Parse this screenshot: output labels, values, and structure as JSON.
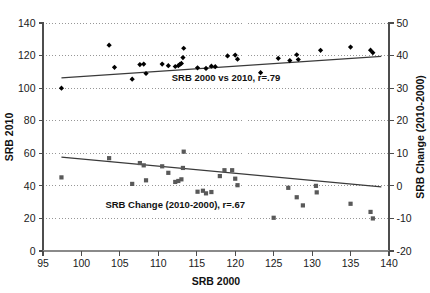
{
  "chart_data": {
    "type": "scatter",
    "title": "",
    "xlabel": "SRB 2000",
    "ylabel": "SRB 2010",
    "y2label": "SRB Change (2010-2000)",
    "xlim": [
      95,
      140
    ],
    "ylim": [
      0,
      140
    ],
    "y2lim": [
      -20,
      50
    ],
    "xticks": [
      95,
      100,
      105,
      110,
      115,
      120,
      125,
      130,
      135,
      140
    ],
    "yticks": [
      0,
      20,
      40,
      60,
      80,
      100,
      120,
      140
    ],
    "y2ticks": [
      -20,
      -10,
      0,
      10,
      20,
      30,
      40,
      50
    ],
    "grid": true,
    "grid_style": "dotted-horizontal",
    "legend_position": "none",
    "annotations": [
      {
        "name": "srb-2000-vs-2010-annotation",
        "text": "SRB 2000 vs 2010, r=.79",
        "x": 118.8,
        "y_left": 104.5
      },
      {
        "name": "srb-change-annotation",
        "text": "SRB Change (2010-2000), r=.67",
        "x": 112.2,
        "y_left": 26.5
      }
    ],
    "series": [
      {
        "name": "SRB 2000 vs 2010",
        "axis": "left",
        "marker": "diamond",
        "color": "#000000",
        "correlation": ".79",
        "points": [
          [
            97.4,
            100.0
          ],
          [
            103.6,
            126.4
          ],
          [
            104.3,
            112.8
          ],
          [
            106.6,
            105.5
          ],
          [
            107.6,
            114.5
          ],
          [
            108.1,
            114.8
          ],
          [
            108.4,
            109.0
          ],
          [
            110.5,
            114.8
          ],
          [
            111.3,
            113.8
          ],
          [
            112.2,
            113.3
          ],
          [
            112.6,
            113.8
          ],
          [
            112.8,
            114.6
          ],
          [
            113.0,
            115.2
          ],
          [
            113.2,
            118.8
          ],
          [
            113.3,
            124.5
          ],
          [
            115.1,
            112.5
          ],
          [
            116.2,
            112.1
          ],
          [
            116.9,
            113.5
          ],
          [
            117.4,
            113.2
          ],
          [
            119.0,
            119.8
          ],
          [
            120.0,
            120.3
          ],
          [
            120.3,
            117.8
          ],
          [
            123.3,
            109.5
          ],
          [
            125.6,
            118.3
          ],
          [
            127.1,
            116.9
          ],
          [
            128.0,
            120.5
          ],
          [
            128.2,
            117.6
          ],
          [
            131.1,
            123.2
          ],
          [
            135.0,
            125.2
          ],
          [
            137.6,
            123.3
          ],
          [
            137.9,
            121.8
          ]
        ],
        "trendline": {
          "x1": 97.4,
          "y1": 106.3,
          "x2": 139.0,
          "y2": 119.5
        }
      },
      {
        "name": "SRB Change (2010-2000)",
        "axis": "right",
        "marker": "square",
        "color": "#595959",
        "correlation": ".67",
        "points": [
          [
            97.4,
            2.6
          ],
          [
            103.6,
            8.5
          ],
          [
            106.6,
            0.6
          ],
          [
            107.6,
            7.0
          ],
          [
            108.1,
            6.3
          ],
          [
            108.4,
            1.7
          ],
          [
            110.5,
            6.0
          ],
          [
            111.3,
            4.0
          ],
          [
            112.2,
            1.2
          ],
          [
            112.6,
            1.5
          ],
          [
            113.0,
            2.0
          ],
          [
            113.2,
            5.5
          ],
          [
            113.3,
            10.5
          ],
          [
            115.1,
            -1.8
          ],
          [
            115.8,
            -1.5
          ],
          [
            116.2,
            -2.3
          ],
          [
            116.9,
            -1.9
          ],
          [
            118.0,
            3.0
          ],
          [
            118.6,
            4.8
          ],
          [
            119.6,
            4.8
          ],
          [
            120.0,
            2.2
          ],
          [
            120.3,
            0.2
          ],
          [
            125.0,
            -9.8
          ],
          [
            126.9,
            -0.6
          ],
          [
            128.0,
            -3.5
          ],
          [
            128.8,
            -6.0
          ],
          [
            130.5,
            0.0
          ],
          [
            130.6,
            -2.0
          ],
          [
            135.0,
            -5.5
          ],
          [
            137.6,
            -8.0
          ],
          [
            137.9,
            -10.0
          ]
        ],
        "trendline": {
          "x1": 97.4,
          "y1": 8.8,
          "x2": 139.0,
          "y2": -0.3
        }
      }
    ]
  },
  "axes": {
    "left": {
      "title": "SRB 2010",
      "labels": [
        "0",
        "20",
        "40",
        "60",
        "80",
        "100",
        "120",
        "140"
      ]
    },
    "right": {
      "title": "SRB Change (2010-2000)",
      "labels": [
        "-20",
        "-10",
        "0",
        "10",
        "20",
        "30",
        "40",
        "50"
      ]
    },
    "bottom": {
      "title": "SRB 2000",
      "labels": [
        "95",
        "100",
        "105",
        "110",
        "115",
        "120",
        "125",
        "130",
        "135",
        "140"
      ]
    }
  },
  "colors": {
    "diamond_series": "#000000",
    "square_series": "#595959",
    "trendline": "#3a3a3a",
    "grid": "#8c8c8c",
    "axis": "#6b6b6b",
    "background": "#ffffff"
  }
}
